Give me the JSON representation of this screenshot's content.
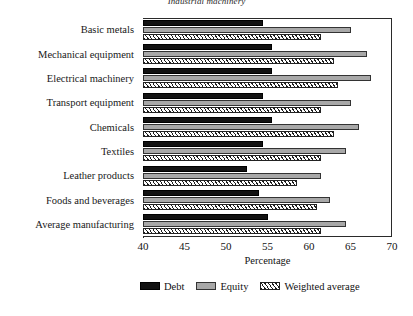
{
  "chart_data": {
    "type": "bar",
    "orientation": "horizontal",
    "title": "Industrial machinery",
    "xlabel": "Percentage",
    "ylabel": "",
    "xlim": [
      40,
      70
    ],
    "xticks": [
      40,
      45,
      50,
      55,
      60,
      65,
      70
    ],
    "grid": false,
    "legend_position": "bottom",
    "categories": [
      "Basic metals",
      "Mechanical equipment",
      "Electrical machinery",
      "Transport equipment",
      "Chemicals",
      "Textiles",
      "Leather products",
      "Foods and beverages",
      "Average manufacturing"
    ],
    "series": [
      {
        "name": "Debt",
        "color": "#121212",
        "values": [
          54.5,
          55.5,
          55.5,
          54.5,
          55.5,
          54.5,
          52.5,
          54.0,
          55.0
        ]
      },
      {
        "name": "Equity",
        "color": "#a8a8a8",
        "values": [
          65.0,
          67.0,
          67.5,
          65.0,
          66.0,
          64.5,
          61.5,
          62.5,
          64.5
        ]
      },
      {
        "name": "Weighted average",
        "color": "#ffffff",
        "values": [
          61.5,
          63.0,
          63.5,
          61.5,
          63.0,
          61.5,
          58.5,
          61.0,
          61.5
        ]
      }
    ]
  },
  "legend": {
    "items": [
      {
        "label": "Debt"
      },
      {
        "label": "Equity"
      },
      {
        "label": "Weighted average"
      }
    ]
  }
}
